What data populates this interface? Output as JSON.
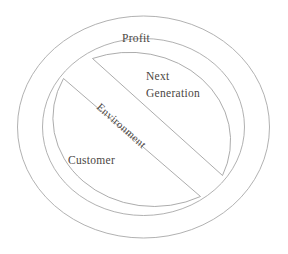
{
  "diagram": {
    "type": "concentric-ring-with-diagonal-band",
    "background_color": "#ffffff",
    "line_color": "#a3a3a3",
    "text_color": "#4a4642",
    "outer_ring": {
      "label": "Profit"
    },
    "upper_sector": {
      "label_line1": "Next",
      "label_line2": "Generation"
    },
    "lower_sector": {
      "label": "Customer"
    },
    "diagonal_band": {
      "label": "Environment"
    }
  }
}
